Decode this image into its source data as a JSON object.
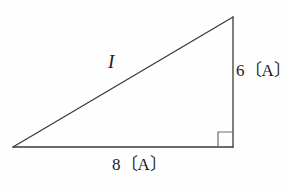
{
  "figure": {
    "type": "right-triangle-diagram",
    "background_color": "#fefefe",
    "stroke_color": "#3a3a3a",
    "text_color": "#1b1b1b",
    "labels": {
      "hypotenuse": "I",
      "vertical_side": "6〔A〕",
      "horizontal_side": "8〔A〕"
    },
    "geometry": {
      "left_vertex": [
        13,
        147
      ],
      "top_vertex": [
        233,
        17
      ],
      "right_vertex": [
        233,
        147
      ],
      "right_angle_marker": {
        "x": 218,
        "y": 132,
        "size": 15
      }
    },
    "values": {
      "vertical_magnitude": 6,
      "horizontal_magnitude": 8,
      "unit": "A",
      "resultant_symbol": "I"
    }
  }
}
